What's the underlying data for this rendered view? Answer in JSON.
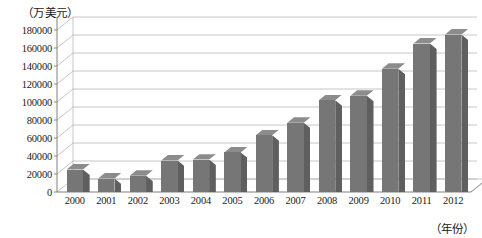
{
  "chart_data": {
    "type": "bar",
    "title": "",
    "subtitle": "",
    "xlabel": "（年份）",
    "ylabel": "（万美元）",
    "unit_label": "（万美元）",
    "categories": [
      "2000",
      "2001",
      "2002",
      "2003",
      "2004",
      "2005",
      "2006",
      "2007",
      "2008",
      "2009",
      "2010",
      "2011",
      "2012"
    ],
    "values": [
      25000,
      15000,
      18000,
      35000,
      36000,
      44000,
      63000,
      77000,
      102000,
      107000,
      137000,
      165000,
      175000
    ],
    "ylim": [
      0,
      180000
    ],
    "ytick_values": [
      0,
      20000,
      40000,
      60000,
      80000,
      100000,
      120000,
      140000,
      160000,
      180000
    ],
    "ytick_labels": [
      "0",
      "20000",
      "40000",
      "60000",
      "80000",
      "100000",
      "120000",
      "140000",
      "160000",
      "180000"
    ],
    "grid": true,
    "legend": false,
    "legend_position": "none",
    "style": "3d-column",
    "series": [
      {
        "name": "",
        "values": [
          25000,
          15000,
          18000,
          35000,
          36000,
          44000,
          63000,
          77000,
          102000,
          107000,
          137000,
          165000,
          175000
        ]
      }
    ],
    "colors": {
      "bar_front": "#767676",
      "bar_side": "#5f5f5f",
      "bar_top": "#8c8c8c",
      "grid": "#b8b8b8",
      "axis": "#808080",
      "text": "#1a1a1a",
      "background": "#ffffff"
    }
  }
}
